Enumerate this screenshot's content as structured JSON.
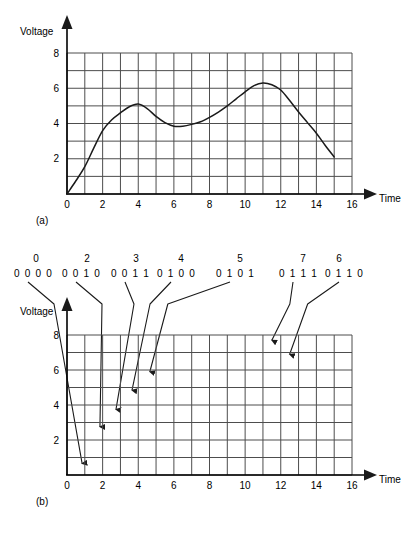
{
  "figure": {
    "panel_a_caption": "(a)",
    "panel_b_caption": "(b)"
  },
  "chart_data": [
    {
      "id": "panel-a",
      "type": "line",
      "title": "",
      "xlabel": "Time",
      "ylabel": "Voltage",
      "xlim": [
        0,
        16
      ],
      "ylim": [
        0,
        8
      ],
      "xticks": [
        0,
        2,
        4,
        6,
        8,
        10,
        12,
        14,
        16
      ],
      "xtick_labels": [
        "0",
        "2",
        "4",
        "6",
        "8",
        "10",
        "12",
        "14",
        "16"
      ],
      "yticks": [
        2,
        4,
        6,
        8
      ],
      "ytick_labels": [
        "2",
        "4",
        "6",
        "8"
      ],
      "grid": true,
      "grid_step_x": 1,
      "grid_step_y": 1,
      "legend": "none",
      "series": [
        {
          "name": "analog-signal",
          "x": [
            0,
            0.5,
            1,
            1.5,
            2,
            2.5,
            3,
            3.5,
            4,
            4.5,
            5,
            5.5,
            6,
            6.5,
            7,
            7.5,
            8,
            8.5,
            9,
            9.5,
            10,
            10.5,
            11,
            11.5,
            12,
            12.5,
            13,
            13.5,
            14,
            14.5,
            15
          ],
          "y": [
            0.0,
            0.75,
            1.55,
            2.6,
            3.6,
            4.2,
            4.6,
            4.95,
            5.1,
            4.85,
            4.4,
            4.05,
            3.85,
            3.85,
            3.95,
            4.1,
            4.35,
            4.65,
            5.0,
            5.4,
            5.8,
            6.15,
            6.3,
            6.2,
            5.9,
            5.3,
            4.65,
            4.05,
            3.45,
            2.75,
            2.1
          ]
        }
      ]
    },
    {
      "id": "panel-b",
      "type": "scatter",
      "title": "",
      "xlabel": "Time",
      "ylabel": "Voltage",
      "xlim": [
        0,
        16
      ],
      "ylim": [
        0,
        8
      ],
      "xticks": [
        0,
        2,
        4,
        6,
        8,
        10,
        12,
        14,
        16
      ],
      "xtick_labels": [
        "0",
        "2",
        "4",
        "6",
        "8",
        "10",
        "12",
        "14",
        "16"
      ],
      "yticks": [
        2,
        4,
        6,
        8
      ],
      "ytick_labels": [
        "2",
        "4",
        "6",
        "8"
      ],
      "grid": true,
      "grid_step_x": 1,
      "grid_step_y": 1,
      "legend": "none",
      "annotations": [
        {
          "decimal": "0",
          "binary": "0 0 0 0",
          "dec_x": 36,
          "bin_x": 14,
          "sample_x": 0.85,
          "sample_y": 0.25
        },
        {
          "decimal": "2",
          "binary": "0 0 1 0",
          "dec_x": 87,
          "bin_x": 62,
          "sample_x": 1.85,
          "sample_y": 2.35
        },
        {
          "decimal": "3",
          "binary": "0 0 1 1",
          "dec_x": 136,
          "bin_x": 111,
          "sample_x": 2.75,
          "sample_y": 3.35
        },
        {
          "decimal": "4",
          "binary": "0 1 0 0",
          "dec_x": 181,
          "bin_x": 157,
          "sample_x": 3.65,
          "sample_y": 4.45
        },
        {
          "decimal": "5",
          "binary": "0 1 0 1",
          "dec_x": 240,
          "bin_x": 216,
          "sample_x": 4.65,
          "sample_y": 5.5
        },
        {
          "decimal": "7",
          "binary": "0 1 1 1",
          "dec_x": 303,
          "bin_x": 279,
          "sample_x": 11.5,
          "sample_y": 7.3
        },
        {
          "decimal": "6",
          "binary": "0 1 1 0",
          "dec_x": 339,
          "bin_x": 325,
          "sample_x": 12.5,
          "sample_y": 6.5
        }
      ]
    }
  ]
}
